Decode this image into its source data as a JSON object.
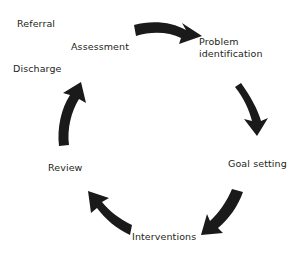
{
  "diagram": {
    "type": "cyclical-process-diagram",
    "background_color": "#ffffff",
    "text_color": "#231f20",
    "arrow_color": "#1a1a1a",
    "direction": "clockwise",
    "labels": [
      {
        "id": "referral",
        "text": "Referral",
        "position": "top-left-outer"
      },
      {
        "id": "assessment",
        "text": "Assessment",
        "position": "top-left-inner"
      },
      {
        "id": "discharge",
        "text": "Discharge",
        "position": "left-upper"
      },
      {
        "id": "problem",
        "text": "Problem\nidentification",
        "line1": "Problem",
        "line2": "identification",
        "position": "right-upper"
      },
      {
        "id": "goal",
        "text": "Goal setting",
        "position": "right-lower"
      },
      {
        "id": "interventions",
        "text": "Interventions",
        "position": "bottom"
      },
      {
        "id": "review",
        "text": "Review",
        "position": "left-lower"
      }
    ],
    "arrows": [
      {
        "id": "arrow-top",
        "from": "assessment",
        "to": "problem",
        "points": "right-up"
      },
      {
        "id": "arrow-right",
        "from": "problem",
        "to": "goal",
        "points": "down"
      },
      {
        "id": "arrow-bottom-right",
        "from": "goal",
        "to": "interventions",
        "points": "down-left"
      },
      {
        "id": "arrow-bottom-left",
        "from": "interventions",
        "to": "review",
        "points": "up-left"
      },
      {
        "id": "arrow-left",
        "from": "review",
        "to": "assessment",
        "points": "up"
      }
    ]
  }
}
